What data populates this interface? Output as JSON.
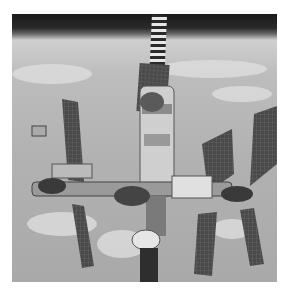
{
  "image": {
    "subject": "space station in orbit above Earth",
    "style": "grayscale photograph",
    "colors": {
      "space": "#1f1f1f",
      "earth": "#b5b5b5",
      "clouds": "#e2e2e2",
      "panels": "#3c3c3c",
      "modules": "#d0d0d0",
      "background": "#ffffff"
    }
  }
}
